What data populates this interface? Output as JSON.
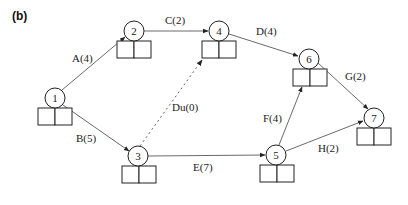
{
  "panel_label": "(b)",
  "colors": {
    "line": "#444444",
    "text": "#222222",
    "background": "#ffffff"
  },
  "nodes": [
    {
      "id": "1",
      "label": "1",
      "cx": 55,
      "cy": 98
    },
    {
      "id": "2",
      "label": "2",
      "cx": 134,
      "cy": 31
    },
    {
      "id": "3",
      "label": "3",
      "cx": 138,
      "cy": 156
    },
    {
      "id": "4",
      "label": "4",
      "cx": 219,
      "cy": 31
    },
    {
      "id": "5",
      "label": "5",
      "cx": 276,
      "cy": 155
    },
    {
      "id": "6",
      "label": "6",
      "cx": 309,
      "cy": 59
    },
    {
      "id": "7",
      "label": "7",
      "cx": 374,
      "cy": 118
    }
  ],
  "edges": [
    {
      "id": "A",
      "label": "A(4)",
      "from": "1",
      "to": "2",
      "style": "solid"
    },
    {
      "id": "B",
      "label": "B(5)",
      "from": "1",
      "to": "3",
      "style": "solid"
    },
    {
      "id": "C",
      "label": "C(2)",
      "from": "2",
      "to": "4",
      "style": "solid"
    },
    {
      "id": "D",
      "label": "D(4)",
      "from": "4",
      "to": "6",
      "style": "solid"
    },
    {
      "id": "Du",
      "label": "Du(0)",
      "from": "3",
      "to": "4",
      "style": "dashed"
    },
    {
      "id": "E",
      "label": "E(7)",
      "from": "3",
      "to": "5",
      "style": "solid"
    },
    {
      "id": "F",
      "label": "F(4)",
      "from": "5",
      "to": "6",
      "style": "solid"
    },
    {
      "id": "G",
      "label": "G(2)",
      "from": "6",
      "to": "7",
      "style": "solid"
    },
    {
      "id": "H",
      "label": "H(2)",
      "from": "5",
      "to": "7",
      "style": "solid"
    }
  ]
}
